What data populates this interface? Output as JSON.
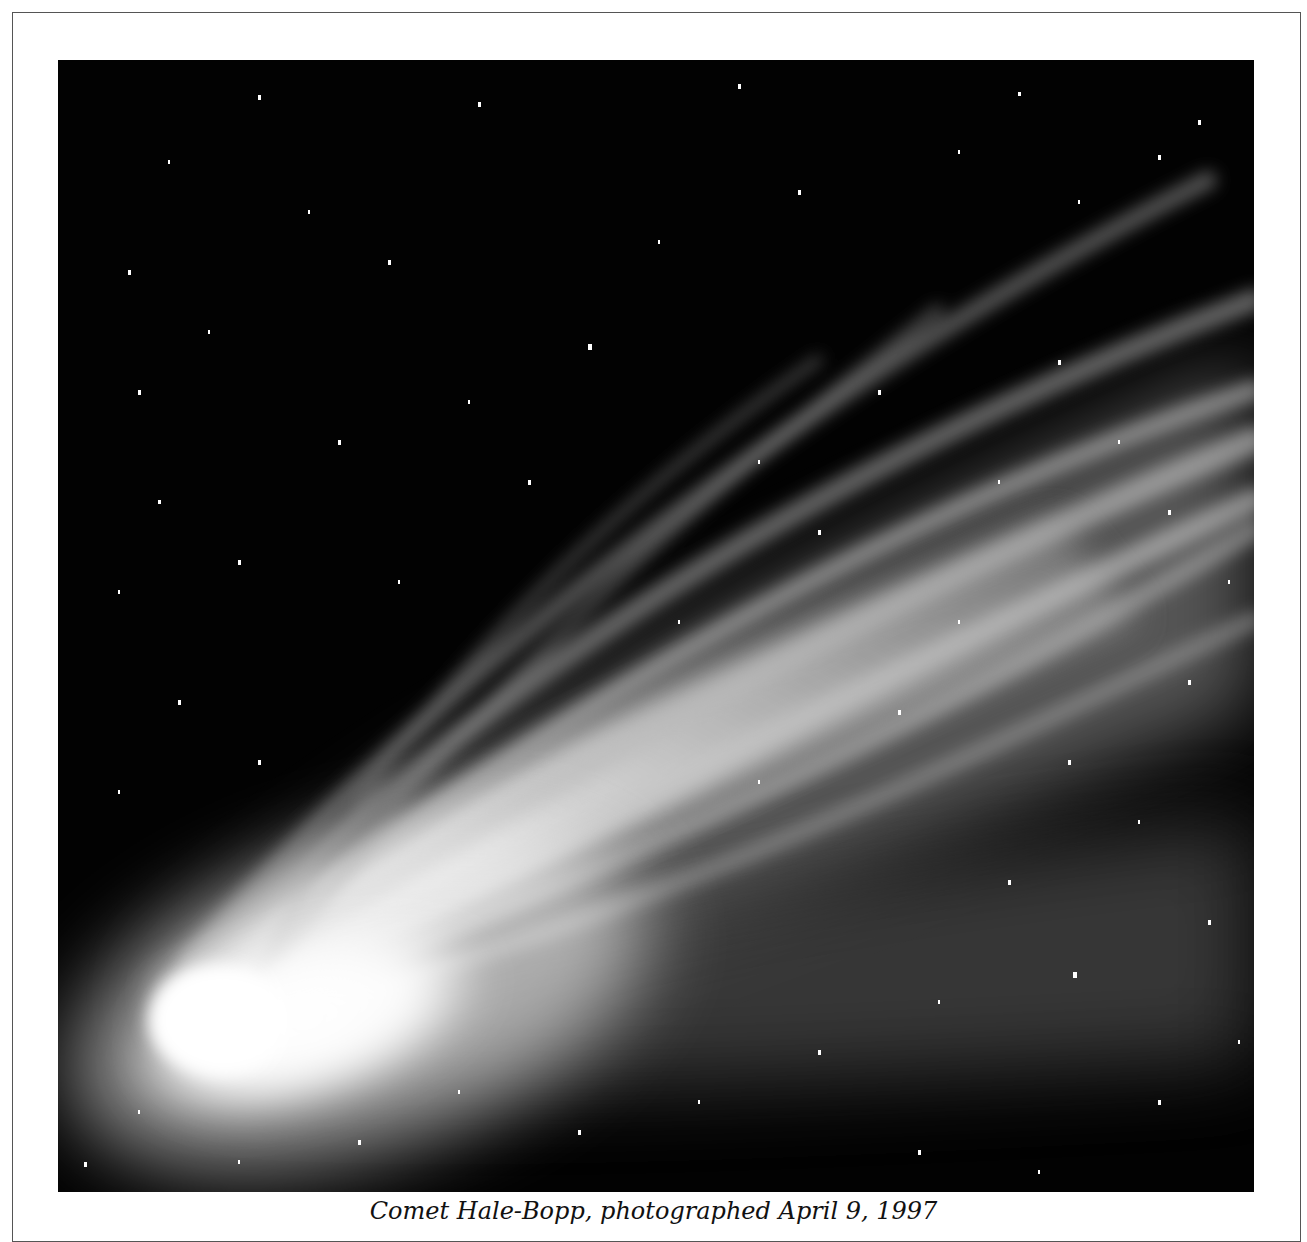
{
  "figure": {
    "caption": "Comet Hale-Bopp, photographed April 9, 1997",
    "photo_alt": "Black-and-white photograph of a bright comet with a broad, streaked tail fanning toward the upper right against a star field",
    "colors": {
      "sky": "#020202",
      "coma": "#ffffff",
      "tail": "#bdbdbd",
      "frame_border": "#555555",
      "page": "#ffffff"
    }
  }
}
